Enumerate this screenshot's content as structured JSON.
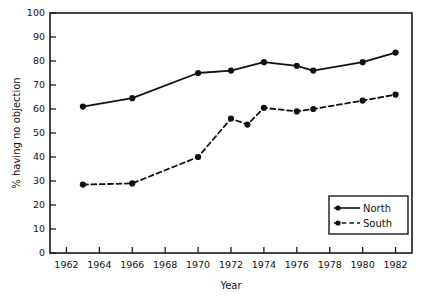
{
  "chart_data": {
    "type": "line",
    "title": "",
    "subtitle": "",
    "xlabel": "Year",
    "ylabel": "% having no objection",
    "xlim": [
      1961,
      1983
    ],
    "ylim": [
      0,
      100
    ],
    "grid": false,
    "legend_position": "bottom-right",
    "xticks": [
      1962,
      1964,
      1966,
      1968,
      1970,
      1972,
      1974,
      1976,
      1978,
      1980,
      1982
    ],
    "xtick_labels": [
      "1962",
      "1964",
      "1966",
      "1968",
      "1970",
      "1972",
      "1974",
      "1976",
      "1978",
      "1980",
      "1982"
    ],
    "yticks": [
      0,
      10,
      20,
      30,
      40,
      50,
      60,
      70,
      80,
      90,
      100
    ],
    "ytick_labels": [
      "0",
      "10",
      "20",
      "30",
      "40",
      "50",
      "60",
      "70",
      "80",
      "90",
      "100"
    ],
    "series": [
      {
        "name": "North",
        "style": "solid",
        "marker": "filled-circle",
        "color": "#111111",
        "x": [
          1963,
          1966,
          1970,
          1972,
          1974,
          1976,
          1977,
          1980,
          1982
        ],
        "values": [
          61,
          64.5,
          75,
          76,
          79.5,
          78,
          76,
          79.5,
          83.5
        ]
      },
      {
        "name": "South",
        "style": "dashed",
        "marker": "filled-circle",
        "color": "#111111",
        "x": [
          1963,
          1966,
          1970,
          1972,
          1973,
          1974,
          1976,
          1977,
          1980,
          1982
        ],
        "values": [
          28.5,
          29,
          40,
          56,
          53.5,
          60.5,
          59,
          60,
          63.5,
          66
        ]
      }
    ]
  },
  "legend": {
    "entries": [
      {
        "label": "North"
      },
      {
        "label": "South"
      }
    ]
  },
  "axes": {
    "x_title": "Year",
    "y_title": "% having no objection"
  }
}
